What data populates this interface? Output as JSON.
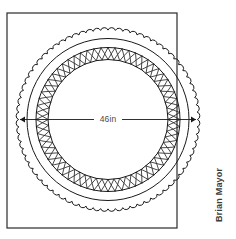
{
  "drawing": {
    "title": "Round table top technical drawing",
    "background_color": "#ffffff",
    "line_color": "#1a1a1a",
    "frame": {
      "name": "drawing-border",
      "x": 7,
      "y": 13,
      "width": 170,
      "height": 215,
      "stroke_width": 1.2,
      "stroke_color": "#2b2b2b"
    },
    "center": {
      "x": 108,
      "y": 119.5
    },
    "rings": [
      {
        "name": "scalloped-outer-edge",
        "style": "scalloped",
        "radius": 92,
        "scallop_count": 76,
        "scallop_depth": 2.6,
        "stroke_width": 1.0
      },
      {
        "name": "outer-plain-circle",
        "style": "plain",
        "radius": 81,
        "stroke_width": 1.0
      },
      {
        "name": "lattice-band-outer-circle",
        "style": "plain",
        "radius": 72,
        "stroke_width": 1.0
      },
      {
        "name": "lattice-band-inner-circle",
        "style": "plain",
        "radius": 60,
        "stroke_width": 1.0
      }
    ],
    "lattice": {
      "name": "cross-hatch-lattice-band",
      "outer_radius": 72,
      "inner_radius": 60,
      "cell_count": 64,
      "stroke_width": 0.8,
      "description": "braided X cross-hatch pattern ring"
    },
    "dimension": {
      "name": "diameter-dimension",
      "label": "46in",
      "value": 46,
      "unit": "in",
      "line_y": 119.5,
      "x_start": 20,
      "x_end": 196,
      "arrow_size": 5,
      "label_x": 108,
      "label_y": 120,
      "stroke_width": 0.9
    }
  },
  "credit": {
    "name": "author-credit",
    "text": "Brian Mayor",
    "rotation": -90,
    "x": 222,
    "y": 222
  }
}
